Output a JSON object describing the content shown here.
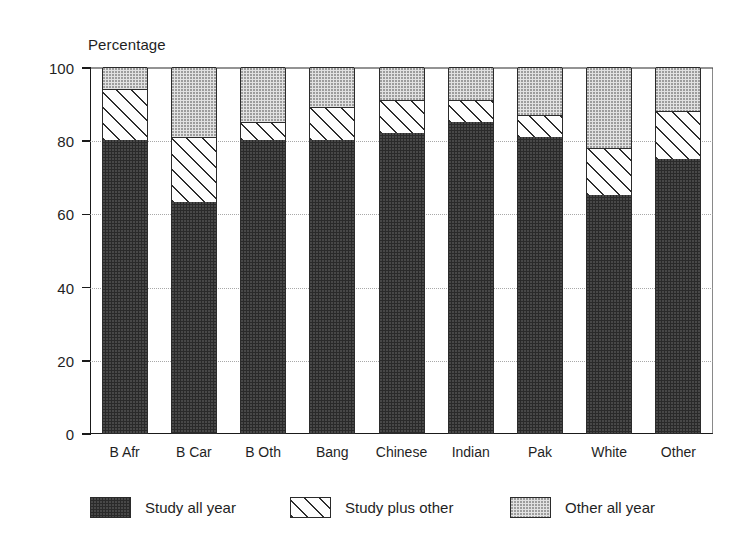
{
  "chart_data": {
    "type": "bar",
    "subtype": "stacked-bar",
    "title": "",
    "xlabel": "",
    "ylabel": "Percentage",
    "ylim": [
      0,
      100
    ],
    "yticks": [
      0,
      20,
      40,
      60,
      80,
      100
    ],
    "ytick_labels": [
      "0",
      "20",
      "40",
      "60",
      "80",
      "100"
    ],
    "grid": "dotted-horizontal-faint",
    "legend_position": "bottom",
    "categories": [
      "B Afr",
      "B Car",
      "B Oth",
      "Bang",
      "Chinese",
      "Indian",
      "Pak",
      "White",
      "Other"
    ],
    "series": [
      {
        "name": "Study all year",
        "pattern": "solid-dark",
        "color": "#2a2a2a",
        "values": [
          80,
          63,
          80,
          80,
          82,
          85,
          81,
          65,
          75
        ]
      },
      {
        "name": "Study plus other",
        "pattern": "diagonal-hatch",
        "color": "#ffffff",
        "values": [
          14,
          18,
          5,
          9,
          9,
          6,
          6,
          13,
          13
        ]
      },
      {
        "name": "Other all year",
        "pattern": "light-dotted",
        "color": "#e2e2e2",
        "values": [
          6,
          19,
          15,
          11,
          9,
          9,
          13,
          22,
          12
        ]
      }
    ],
    "cumulative_tops": {
      "study_all_year": [
        80,
        63,
        80,
        80,
        82,
        85,
        81,
        65,
        75
      ],
      "study_plus_other": [
        94,
        81,
        85,
        89,
        91,
        91,
        87,
        78,
        88
      ],
      "other_all_year": [
        100,
        100,
        100,
        100,
        100,
        100,
        100,
        100,
        100
      ]
    }
  },
  "legend": {
    "items": [
      {
        "label": "Study all year",
        "swatch": "solid-dark-swatch"
      },
      {
        "label": "Study plus other",
        "swatch": "diagonal-hatch-swatch"
      },
      {
        "label": "Other all year",
        "swatch": "light-dotted-swatch"
      }
    ]
  }
}
